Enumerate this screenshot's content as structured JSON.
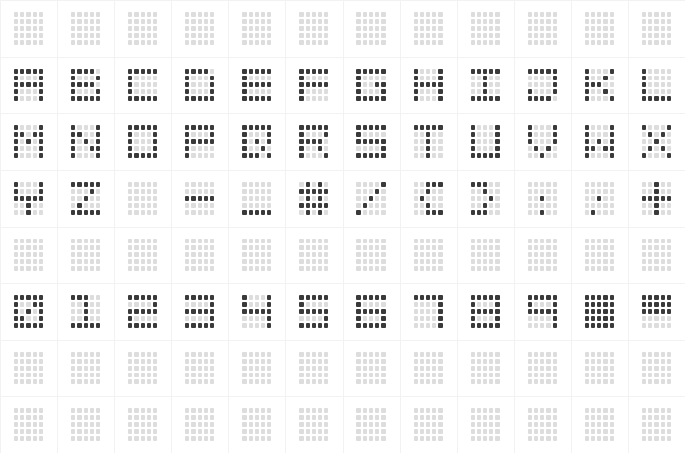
{
  "display": {
    "kind": "dot-matrix-character-chart",
    "columns": 12,
    "rows": 8,
    "cell_dot_columns": 5,
    "cell_dot_rows": 5,
    "dot_off_color": "#dddddd",
    "dot_on_color": "#3a3a3a",
    "background_color": "#ffffff",
    "gridline_color": "#f2f2f2"
  },
  "cells": [
    {
      "row": 1,
      "col": 1,
      "name": "blank",
      "label": " ",
      "pattern": [
        "00000",
        "00000",
        "00000",
        "00000",
        "00000"
      ]
    },
    {
      "row": 1,
      "col": 2,
      "name": "blank",
      "label": " ",
      "pattern": [
        "00000",
        "00000",
        "00000",
        "00000",
        "00000"
      ]
    },
    {
      "row": 1,
      "col": 3,
      "name": "blank",
      "label": " ",
      "pattern": [
        "00000",
        "00000",
        "00000",
        "00000",
        "00000"
      ]
    },
    {
      "row": 1,
      "col": 4,
      "name": "blank",
      "label": " ",
      "pattern": [
        "00000",
        "00000",
        "00000",
        "00000",
        "00000"
      ]
    },
    {
      "row": 1,
      "col": 5,
      "name": "blank",
      "label": " ",
      "pattern": [
        "00000",
        "00000",
        "00000",
        "00000",
        "00000"
      ]
    },
    {
      "row": 1,
      "col": 6,
      "name": "blank",
      "label": " ",
      "pattern": [
        "00000",
        "00000",
        "00000",
        "00000",
        "00000"
      ]
    },
    {
      "row": 1,
      "col": 7,
      "name": "blank",
      "label": " ",
      "pattern": [
        "00000",
        "00000",
        "00000",
        "00000",
        "00000"
      ]
    },
    {
      "row": 1,
      "col": 8,
      "name": "blank",
      "label": " ",
      "pattern": [
        "00000",
        "00000",
        "00000",
        "00000",
        "00000"
      ]
    },
    {
      "row": 1,
      "col": 9,
      "name": "blank",
      "label": " ",
      "pattern": [
        "00000",
        "00000",
        "00000",
        "00000",
        "00000"
      ]
    },
    {
      "row": 1,
      "col": 10,
      "name": "blank",
      "label": " ",
      "pattern": [
        "00000",
        "00000",
        "00000",
        "00000",
        "00000"
      ]
    },
    {
      "row": 1,
      "col": 11,
      "name": "blank",
      "label": " ",
      "pattern": [
        "00000",
        "00000",
        "00000",
        "00000",
        "00000"
      ]
    },
    {
      "row": 1,
      "col": 12,
      "name": "blank",
      "label": " ",
      "pattern": [
        "00000",
        "00000",
        "00000",
        "00000",
        "00000"
      ]
    },
    {
      "row": 2,
      "col": 1,
      "name": "letter-a",
      "label": "A",
      "pattern": [
        "11111",
        "10001",
        "11111",
        "10001",
        "10001"
      ]
    },
    {
      "row": 2,
      "col": 2,
      "name": "letter-b",
      "label": "B",
      "pattern": [
        "11110",
        "10001",
        "11110",
        "10001",
        "11111"
      ]
    },
    {
      "row": 2,
      "col": 3,
      "name": "letter-c",
      "label": "C",
      "pattern": [
        "11111",
        "10000",
        "10000",
        "10000",
        "11111"
      ]
    },
    {
      "row": 2,
      "col": 4,
      "name": "letter-d",
      "label": "D",
      "pattern": [
        "11110",
        "10001",
        "10001",
        "10001",
        "11111"
      ]
    },
    {
      "row": 2,
      "col": 5,
      "name": "letter-e",
      "label": "E",
      "pattern": [
        "11111",
        "10000",
        "11111",
        "10000",
        "11111"
      ]
    },
    {
      "row": 2,
      "col": 6,
      "name": "letter-f",
      "label": "F",
      "pattern": [
        "11111",
        "10000",
        "11111",
        "10000",
        "10000"
      ]
    },
    {
      "row": 2,
      "col": 7,
      "name": "letter-g",
      "label": "G",
      "pattern": [
        "11111",
        "10000",
        "10011",
        "10001",
        "11111"
      ]
    },
    {
      "row": 2,
      "col": 8,
      "name": "letter-h",
      "label": "H",
      "pattern": [
        "10001",
        "10001",
        "11111",
        "10001",
        "10001"
      ]
    },
    {
      "row": 2,
      "col": 9,
      "name": "letter-i",
      "label": "I",
      "pattern": [
        "11111",
        "00100",
        "00100",
        "00100",
        "11111"
      ]
    },
    {
      "row": 2,
      "col": 10,
      "name": "letter-j",
      "label": "J",
      "pattern": [
        "11111",
        "00001",
        "00001",
        "10001",
        "11110"
      ]
    },
    {
      "row": 2,
      "col": 11,
      "name": "letter-k",
      "label": "K",
      "pattern": [
        "10001",
        "10010",
        "11100",
        "10010",
        "10001"
      ]
    },
    {
      "row": 2,
      "col": 12,
      "name": "letter-l",
      "label": "L",
      "pattern": [
        "10000",
        "10000",
        "10000",
        "10000",
        "11111"
      ]
    },
    {
      "row": 3,
      "col": 1,
      "name": "letter-m",
      "label": "M",
      "pattern": [
        "10001",
        "11011",
        "10101",
        "10001",
        "10001"
      ]
    },
    {
      "row": 3,
      "col": 2,
      "name": "letter-n",
      "label": "N",
      "pattern": [
        "10001",
        "11001",
        "10101",
        "10011",
        "10001"
      ]
    },
    {
      "row": 3,
      "col": 3,
      "name": "letter-o",
      "label": "O",
      "pattern": [
        "11111",
        "10001",
        "10001",
        "10001",
        "11111"
      ]
    },
    {
      "row": 3,
      "col": 4,
      "name": "letter-p",
      "label": "P",
      "pattern": [
        "11111",
        "10001",
        "11111",
        "10000",
        "10000"
      ]
    },
    {
      "row": 3,
      "col": 5,
      "name": "letter-q",
      "label": "Q",
      "pattern": [
        "11111",
        "10001",
        "10101",
        "10010",
        "11101"
      ]
    },
    {
      "row": 3,
      "col": 6,
      "name": "letter-r",
      "label": "R",
      "pattern": [
        "11111",
        "10001",
        "11110",
        "10010",
        "10001"
      ]
    },
    {
      "row": 3,
      "col": 7,
      "name": "letter-s",
      "label": "S",
      "pattern": [
        "11111",
        "10000",
        "11111",
        "00001",
        "11111"
      ]
    },
    {
      "row": 3,
      "col": 8,
      "name": "letter-t",
      "label": "T",
      "pattern": [
        "11111",
        "00100",
        "00100",
        "00100",
        "00100"
      ]
    },
    {
      "row": 3,
      "col": 9,
      "name": "letter-u",
      "label": "U",
      "pattern": [
        "10001",
        "10001",
        "10001",
        "10001",
        "11111"
      ]
    },
    {
      "row": 3,
      "col": 10,
      "name": "letter-v",
      "label": "V",
      "pattern": [
        "10001",
        "10001",
        "10001",
        "01010",
        "00100"
      ]
    },
    {
      "row": 3,
      "col": 11,
      "name": "letter-w",
      "label": "W",
      "pattern": [
        "10001",
        "10001",
        "10101",
        "11011",
        "10001"
      ]
    },
    {
      "row": 3,
      "col": 12,
      "name": "letter-x",
      "label": "X",
      "pattern": [
        "10001",
        "01010",
        "00100",
        "01010",
        "10001"
      ]
    },
    {
      "row": 4,
      "col": 1,
      "name": "letter-y",
      "label": "Y",
      "pattern": [
        "10001",
        "10001",
        "11111",
        "00100",
        "00100"
      ]
    },
    {
      "row": 4,
      "col": 2,
      "name": "letter-z",
      "label": "Z",
      "pattern": [
        "11111",
        "00010",
        "00100",
        "01000",
        "11111"
      ]
    },
    {
      "row": 4,
      "col": 3,
      "name": "blank",
      "label": " ",
      "pattern": [
        "00000",
        "00000",
        "00000",
        "00000",
        "00000"
      ]
    },
    {
      "row": 4,
      "col": 4,
      "name": "hyphen",
      "label": "-",
      "pattern": [
        "00000",
        "00000",
        "11111",
        "00000",
        "00000"
      ]
    },
    {
      "row": 4,
      "col": 5,
      "name": "underscore",
      "label": "_",
      "pattern": [
        "00000",
        "00000",
        "00000",
        "00000",
        "11111"
      ]
    },
    {
      "row": 4,
      "col": 6,
      "name": "hash",
      "label": "#",
      "pattern": [
        "01010",
        "11111",
        "01010",
        "11111",
        "01010"
      ]
    },
    {
      "row": 4,
      "col": 7,
      "name": "slash",
      "label": "/",
      "pattern": [
        "00001",
        "00010",
        "00100",
        "01000",
        "10000"
      ]
    },
    {
      "row": 4,
      "col": 8,
      "name": "paren-left",
      "label": "(",
      "pattern": [
        "00111",
        "00100",
        "01000",
        "00100",
        "00111"
      ]
    },
    {
      "row": 4,
      "col": 9,
      "name": "paren-right",
      "label": ")",
      "pattern": [
        "11100",
        "00100",
        "00010",
        "00100",
        "11100"
      ]
    },
    {
      "row": 4,
      "col": 10,
      "name": "colon",
      "label": ":",
      "pattern": [
        "00000",
        "00000",
        "00100",
        "00000",
        "00100"
      ]
    },
    {
      "row": 4,
      "col": 11,
      "name": "semicolon",
      "label": ";",
      "pattern": [
        "00000",
        "00000",
        "00100",
        "00000",
        "01000"
      ]
    },
    {
      "row": 4,
      "col": 12,
      "name": "plus",
      "label": "+",
      "pattern": [
        "00100",
        "00100",
        "11111",
        "00100",
        "00100"
      ]
    },
    {
      "row": 5,
      "col": 1,
      "name": "blank",
      "label": " ",
      "pattern": [
        "00000",
        "00000",
        "00000",
        "00000",
        "00000"
      ]
    },
    {
      "row": 5,
      "col": 2,
      "name": "blank",
      "label": " ",
      "pattern": [
        "00000",
        "00000",
        "00000",
        "00000",
        "00000"
      ]
    },
    {
      "row": 5,
      "col": 3,
      "name": "blank",
      "label": " ",
      "pattern": [
        "00000",
        "00000",
        "00000",
        "00000",
        "00000"
      ]
    },
    {
      "row": 5,
      "col": 4,
      "name": "blank",
      "label": " ",
      "pattern": [
        "00000",
        "00000",
        "00000",
        "00000",
        "00000"
      ]
    },
    {
      "row": 5,
      "col": 5,
      "name": "blank",
      "label": " ",
      "pattern": [
        "00000",
        "00000",
        "00000",
        "00000",
        "00000"
      ]
    },
    {
      "row": 5,
      "col": 6,
      "name": "blank",
      "label": " ",
      "pattern": [
        "00000",
        "00000",
        "00000",
        "00000",
        "00000"
      ]
    },
    {
      "row": 5,
      "col": 7,
      "name": "blank",
      "label": " ",
      "pattern": [
        "00000",
        "00000",
        "00000",
        "00000",
        "00000"
      ]
    },
    {
      "row": 5,
      "col": 8,
      "name": "blank",
      "label": " ",
      "pattern": [
        "00000",
        "00000",
        "00000",
        "00000",
        "00000"
      ]
    },
    {
      "row": 5,
      "col": 9,
      "name": "blank",
      "label": " ",
      "pattern": [
        "00000",
        "00000",
        "00000",
        "00000",
        "00000"
      ]
    },
    {
      "row": 5,
      "col": 10,
      "name": "blank",
      "label": " ",
      "pattern": [
        "00000",
        "00000",
        "00000",
        "00000",
        "00000"
      ]
    },
    {
      "row": 5,
      "col": 11,
      "name": "blank",
      "label": " ",
      "pattern": [
        "00000",
        "00000",
        "00000",
        "00000",
        "00000"
      ]
    },
    {
      "row": 5,
      "col": 12,
      "name": "blank",
      "label": " ",
      "pattern": [
        "00000",
        "00000",
        "00000",
        "00000",
        "00000"
      ]
    },
    {
      "row": 6,
      "col": 1,
      "name": "digit-0",
      "label": "0",
      "pattern": [
        "11111",
        "10011",
        "10101",
        "11001",
        "11111"
      ]
    },
    {
      "row": 6,
      "col": 2,
      "name": "digit-1",
      "label": "1",
      "pattern": [
        "11100",
        "00100",
        "00100",
        "00100",
        "11111"
      ]
    },
    {
      "row": 6,
      "col": 3,
      "name": "digit-2",
      "label": "2",
      "pattern": [
        "11111",
        "00001",
        "11111",
        "10000",
        "11111"
      ]
    },
    {
      "row": 6,
      "col": 4,
      "name": "digit-3",
      "label": "3",
      "pattern": [
        "11111",
        "00001",
        "11111",
        "00001",
        "11111"
      ]
    },
    {
      "row": 6,
      "col": 5,
      "name": "digit-4",
      "label": "4",
      "pattern": [
        "10001",
        "10001",
        "11111",
        "00001",
        "00001"
      ]
    },
    {
      "row": 6,
      "col": 6,
      "name": "digit-5",
      "label": "5",
      "pattern": [
        "11111",
        "10000",
        "11111",
        "00001",
        "11111"
      ]
    },
    {
      "row": 6,
      "col": 7,
      "name": "digit-6",
      "label": "6",
      "pattern": [
        "11111",
        "10000",
        "11111",
        "10001",
        "11111"
      ]
    },
    {
      "row": 6,
      "col": 8,
      "name": "digit-7",
      "label": "7",
      "pattern": [
        "11111",
        "00001",
        "00001",
        "00001",
        "00001"
      ]
    },
    {
      "row": 6,
      "col": 9,
      "name": "digit-8",
      "label": "8",
      "pattern": [
        "11111",
        "10001",
        "11111",
        "10001",
        "11111"
      ]
    },
    {
      "row": 6,
      "col": 10,
      "name": "digit-9",
      "label": "9",
      "pattern": [
        "11111",
        "10001",
        "11111",
        "00001",
        "00001"
      ]
    },
    {
      "row": 6,
      "col": 11,
      "name": "full-block",
      "label": "█",
      "pattern": [
        "11111",
        "11111",
        "11111",
        "11111",
        "11111"
      ]
    },
    {
      "row": 6,
      "col": 12,
      "name": "upper-half-block",
      "label": "▀",
      "pattern": [
        "11111",
        "11111",
        "11111",
        "00000",
        "00000"
      ]
    },
    {
      "row": 7,
      "col": 1,
      "name": "blank",
      "label": " ",
      "pattern": [
        "00000",
        "00000",
        "00000",
        "00000",
        "00000"
      ]
    },
    {
      "row": 7,
      "col": 2,
      "name": "blank",
      "label": " ",
      "pattern": [
        "00000",
        "00000",
        "00000",
        "00000",
        "00000"
      ]
    },
    {
      "row": 7,
      "col": 3,
      "name": "blank",
      "label": " ",
      "pattern": [
        "00000",
        "00000",
        "00000",
        "00000",
        "00000"
      ]
    },
    {
      "row": 7,
      "col": 4,
      "name": "blank",
      "label": " ",
      "pattern": [
        "00000",
        "00000",
        "00000",
        "00000",
        "00000"
      ]
    },
    {
      "row": 7,
      "col": 5,
      "name": "blank",
      "label": " ",
      "pattern": [
        "00000",
        "00000",
        "00000",
        "00000",
        "00000"
      ]
    },
    {
      "row": 7,
      "col": 6,
      "name": "blank",
      "label": " ",
      "pattern": [
        "00000",
        "00000",
        "00000",
        "00000",
        "00000"
      ]
    },
    {
      "row": 7,
      "col": 7,
      "name": "blank",
      "label": " ",
      "pattern": [
        "00000",
        "00000",
        "00000",
        "00000",
        "00000"
      ]
    },
    {
      "row": 7,
      "col": 8,
      "name": "blank",
      "label": " ",
      "pattern": [
        "00000",
        "00000",
        "00000",
        "00000",
        "00000"
      ]
    },
    {
      "row": 7,
      "col": 9,
      "name": "blank",
      "label": " ",
      "pattern": [
        "00000",
        "00000",
        "00000",
        "00000",
        "00000"
      ]
    },
    {
      "row": 7,
      "col": 10,
      "name": "blank",
      "label": " ",
      "pattern": [
        "00000",
        "00000",
        "00000",
        "00000",
        "00000"
      ]
    },
    {
      "row": 7,
      "col": 11,
      "name": "blank",
      "label": " ",
      "pattern": [
        "00000",
        "00000",
        "00000",
        "00000",
        "00000"
      ]
    },
    {
      "row": 7,
      "col": 12,
      "name": "blank",
      "label": " ",
      "pattern": [
        "00000",
        "00000",
        "00000",
        "00000",
        "00000"
      ]
    },
    {
      "row": 8,
      "col": 1,
      "name": "blank",
      "label": " ",
      "pattern": [
        "00000",
        "00000",
        "00000",
        "00000",
        "00000"
      ]
    },
    {
      "row": 8,
      "col": 2,
      "name": "blank",
      "label": " ",
      "pattern": [
        "00000",
        "00000",
        "00000",
        "00000",
        "00000"
      ]
    },
    {
      "row": 8,
      "col": 3,
      "name": "blank",
      "label": " ",
      "pattern": [
        "00000",
        "00000",
        "00000",
        "00000",
        "00000"
      ]
    },
    {
      "row": 8,
      "col": 4,
      "name": "blank",
      "label": " ",
      "pattern": [
        "00000",
        "00000",
        "00000",
        "00000",
        "00000"
      ]
    },
    {
      "row": 8,
      "col": 5,
      "name": "blank",
      "label": " ",
      "pattern": [
        "00000",
        "00000",
        "00000",
        "00000",
        "00000"
      ]
    },
    {
      "row": 8,
      "col": 6,
      "name": "blank",
      "label": " ",
      "pattern": [
        "00000",
        "00000",
        "00000",
        "00000",
        "00000"
      ]
    },
    {
      "row": 8,
      "col": 7,
      "name": "blank",
      "label": " ",
      "pattern": [
        "00000",
        "00000",
        "00000",
        "00000",
        "00000"
      ]
    },
    {
      "row": 8,
      "col": 8,
      "name": "blank",
      "label": " ",
      "pattern": [
        "00000",
        "00000",
        "00000",
        "00000",
        "00000"
      ]
    },
    {
      "row": 8,
      "col": 9,
      "name": "blank",
      "label": " ",
      "pattern": [
        "00000",
        "00000",
        "00000",
        "00000",
        "00000"
      ]
    },
    {
      "row": 8,
      "col": 10,
      "name": "blank",
      "label": " ",
      "pattern": [
        "00000",
        "00000",
        "00000",
        "00000",
        "00000"
      ]
    },
    {
      "row": 8,
      "col": 11,
      "name": "blank",
      "label": " ",
      "pattern": [
        "00000",
        "00000",
        "00000",
        "00000",
        "00000"
      ]
    },
    {
      "row": 8,
      "col": 12,
      "name": "blank",
      "label": " ",
      "pattern": [
        "00000",
        "00000",
        "00000",
        "00000",
        "00000"
      ]
    }
  ]
}
